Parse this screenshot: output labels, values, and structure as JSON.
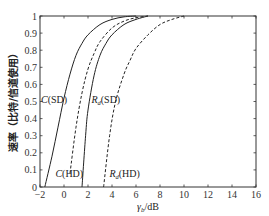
{
  "chart_data": {
    "type": "line",
    "title": "",
    "xlabel": "γb/dB",
    "xlabel_main": "γ",
    "xlabel_sub": "b",
    "xlabel_unit": "/dB",
    "ylabel": "速率（比特/信道使用）",
    "xlim": [
      -2,
      16
    ],
    "ylim": [
      0,
      1
    ],
    "xticks": [
      -2,
      0,
      2,
      4,
      6,
      8,
      10,
      12,
      14,
      16
    ],
    "yticks": [
      0,
      0.1,
      0.2,
      0.3,
      0.4,
      0.5,
      0.6,
      0.7,
      0.8,
      0.9,
      1
    ],
    "ytick_labels": [
      "0",
      "0.1",
      "0.2",
      "0.3",
      "0.4",
      "0.5",
      "0.6",
      "0.7",
      "0.8",
      "0.9",
      "1"
    ],
    "grid": false,
    "legend": "none (inline curve labels)",
    "series": [
      {
        "name": "C(SD)",
        "style": "solid",
        "x": [
          -1.6,
          -1,
          -0.5,
          0,
          0.5,
          1,
          1.5,
          2,
          3,
          4,
          5,
          6
        ],
        "y": [
          0,
          0.18,
          0.35,
          0.52,
          0.66,
          0.77,
          0.84,
          0.89,
          0.95,
          0.98,
          0.995,
          1
        ]
      },
      {
        "name": "C(HD)",
        "style": "dashed",
        "x": [
          0.5,
          1,
          1.5,
          2,
          2.5,
          3,
          4,
          5,
          6,
          7
        ],
        "y": [
          0.08,
          0.35,
          0.55,
          0.69,
          0.78,
          0.85,
          0.93,
          0.97,
          0.99,
          1
        ]
      },
      {
        "name": "Rd(SD)",
        "style": "solid",
        "x": [
          1.5,
          1.8,
          2,
          2.5,
          3,
          3.5,
          4,
          5,
          6,
          7
        ],
        "y": [
          0,
          0.3,
          0.45,
          0.65,
          0.77,
          0.84,
          0.89,
          0.95,
          0.98,
          1
        ]
      },
      {
        "name": "Rd(HD)",
        "style": "dashed",
        "x": [
          3.3,
          3.8,
          4.3,
          5,
          5.5,
          6,
          7,
          8,
          9,
          10
        ],
        "y": [
          0,
          0.3,
          0.5,
          0.66,
          0.74,
          0.81,
          0.89,
          0.95,
          0.98,
          1
        ]
      }
    ],
    "annotations": [
      {
        "text": "C(SD)",
        "main": "C",
        "sub": "",
        "rest": "(SD)",
        "x": -2,
        "y": 0.49
      },
      {
        "text": "C(HD)",
        "main": "C",
        "sub": "",
        "rest": "(HD)",
        "x": -0.8,
        "y": 0.06
      },
      {
        "text": "Rd(SD)",
        "main": "R",
        "sub": "d",
        "rest": "(SD)",
        "x": 2.2,
        "y": 0.49
      },
      {
        "text": "Rd(HD)",
        "main": "R",
        "sub": "d",
        "rest": "(HD)",
        "x": 3.7,
        "y": 0.06
      }
    ]
  },
  "colors": {
    "axis": "#333333",
    "line": "#222222",
    "background": "#ffffff"
  }
}
